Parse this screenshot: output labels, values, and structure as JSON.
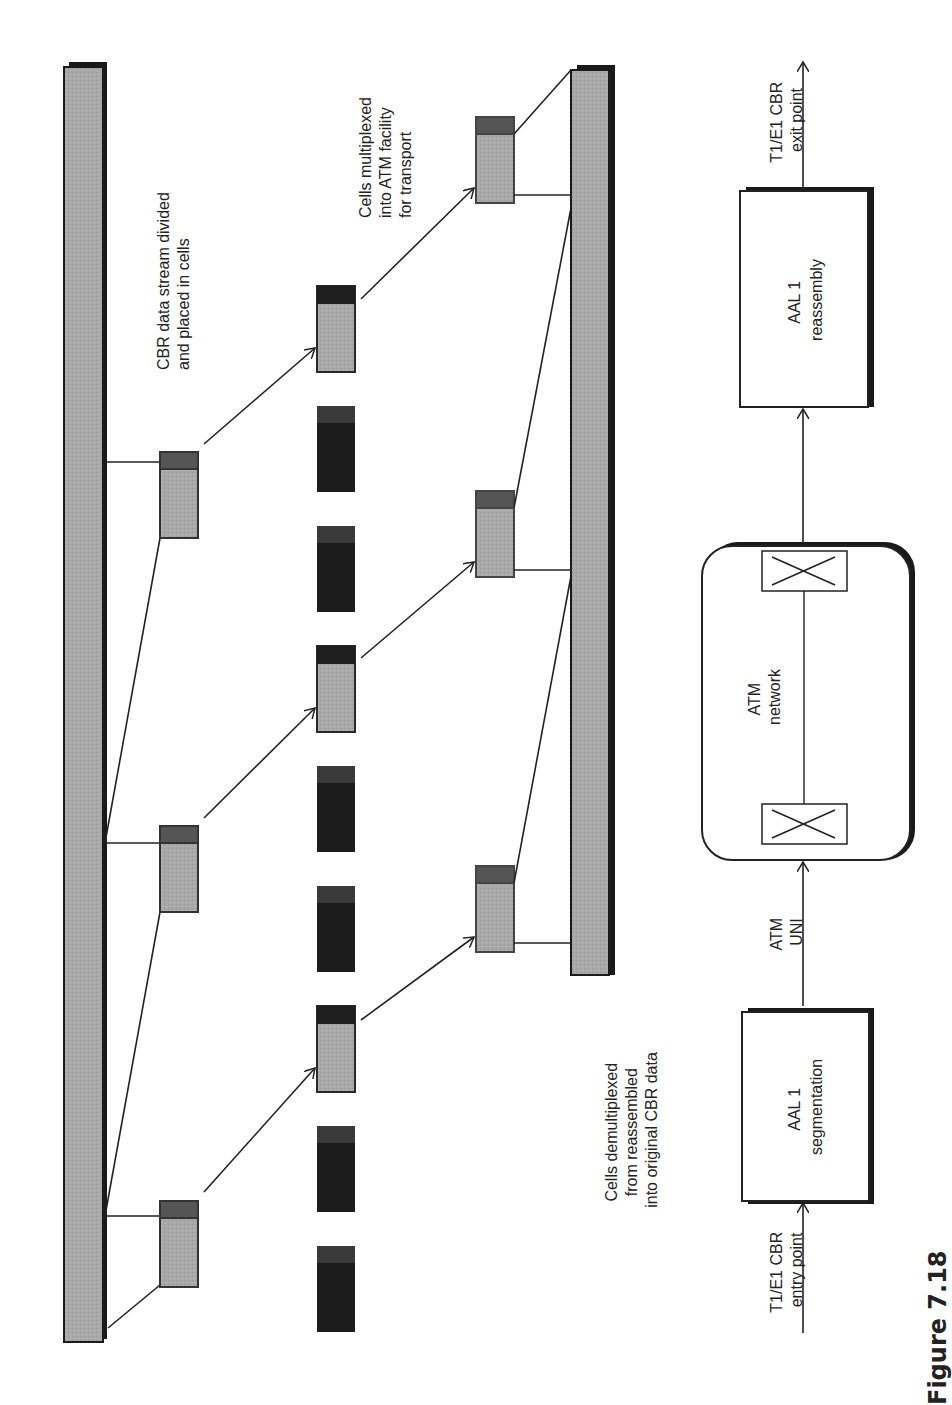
{
  "figure": {
    "caption": "Figure 7.18",
    "orientation": "rotated-90-ccw"
  },
  "colors": {
    "bar_fill": "#a8a8a8",
    "bar_shadow": "#1a1a1a",
    "cell_header": "#555555",
    "cell_payload": "#a8a8a8",
    "cell_dark": "#1c1c1c",
    "line": "#222222",
    "box_fill": "#ffffff"
  },
  "top_section": {
    "source_stream_label": "CBR data stream",
    "labels": {
      "divided": [
        "CBR data stream divided",
        "and placed in cells"
      ],
      "multiplexed": [
        "Cells multiplexed",
        "into ATM facility",
        "for transport"
      ],
      "demultiplexed": [
        "Cells demultiplexed",
        "from reassembled",
        "into original CBR data"
      ]
    },
    "segmented_cells": [
      {
        "id": "seg-1",
        "x": 160,
        "y": 452
      },
      {
        "id": "seg-2",
        "x": 160,
        "y": 826
      },
      {
        "id": "seg-3",
        "x": 160,
        "y": 1201
      }
    ],
    "multiplexed_cells": [
      {
        "id": "mux-1",
        "x": 317,
        "y": 286,
        "type": "user"
      },
      {
        "id": "mux-2",
        "x": 317,
        "y": 406,
        "type": "other"
      },
      {
        "id": "mux-3",
        "x": 317,
        "y": 526,
        "type": "other"
      },
      {
        "id": "mux-4",
        "x": 317,
        "y": 646,
        "type": "user"
      },
      {
        "id": "mux-5",
        "x": 317,
        "y": 766,
        "type": "other"
      },
      {
        "id": "mux-6",
        "x": 317,
        "y": 886,
        "type": "other"
      },
      {
        "id": "mux-7",
        "x": 317,
        "y": 1006,
        "type": "user"
      },
      {
        "id": "mux-8",
        "x": 317,
        "y": 1126,
        "type": "other"
      },
      {
        "id": "mux-9",
        "x": 317,
        "y": 1246,
        "type": "other"
      }
    ],
    "reassembled_cells": [
      {
        "id": "reasm-1",
        "x": 476,
        "y": 117
      },
      {
        "id": "reasm-2",
        "x": 476,
        "y": 491
      },
      {
        "id": "reasm-3",
        "x": 476,
        "y": 866
      }
    ]
  },
  "bottom_section": {
    "entry_label": [
      "T1/E1 CBR",
      "entry point"
    ],
    "segmentation_box": [
      "AAL 1",
      "segmentation"
    ],
    "uni_label": [
      "ATM",
      "UNI"
    ],
    "network_label": [
      "ATM",
      "network"
    ],
    "reassembly_box": [
      "AAL 1",
      "reassembly"
    ],
    "exit_label": [
      "T1/E1 CBR",
      "exit point"
    ]
  }
}
